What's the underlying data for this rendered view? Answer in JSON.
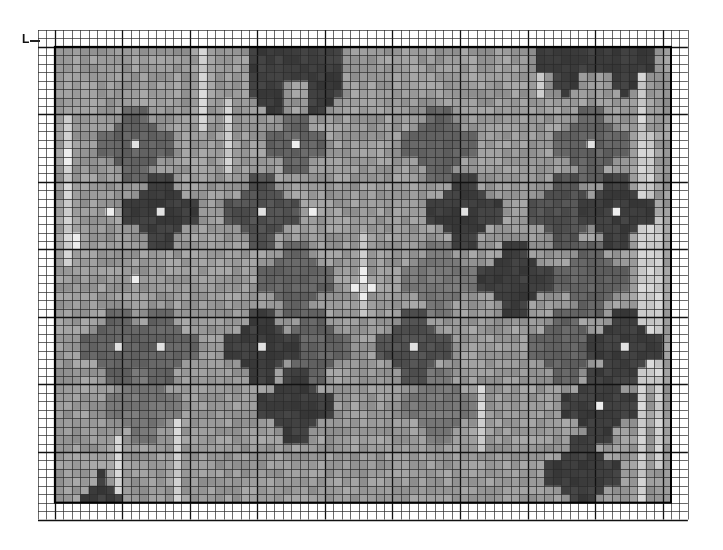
{
  "chart": {
    "type": "needlepoint-grid-chart",
    "marker_label": "L",
    "outer_grid": {
      "x": 38,
      "y": 30,
      "cols": 77,
      "rows": 58,
      "cell": 8.44
    },
    "pattern": {
      "col_offset": 2,
      "row_offset": 2,
      "cols": 73,
      "rows": 54
    },
    "major_every": 8,
    "colors": {
      "background": "#ffffff",
      "grid_line": "#2a2a2a",
      "major_line": "#111111",
      "base_fill": "#9a9a9a",
      "light_fill": "#d6d6d6",
      "highlight_fill": "#f2f2f2",
      "dark_fill": "#3a3a3a"
    },
    "motifs": [
      {
        "col": 9,
        "row": 11,
        "size": 4,
        "shade": "medium",
        "center": "light"
      },
      {
        "col": 12,
        "row": 19,
        "size": 4,
        "shade": "dark",
        "center": "light"
      },
      {
        "col": 7,
        "row": 35,
        "size": 4,
        "shade": "medium",
        "center": "light"
      },
      {
        "col": 12,
        "row": 35,
        "size": 4,
        "shade": "medium",
        "center": "light"
      },
      {
        "col": 10,
        "row": 42,
        "size": 4,
        "shade": "faint",
        "center": "none"
      },
      {
        "col": 5,
        "row": 53,
        "size": 3,
        "shade": "dark",
        "center": "none",
        "kind": "triangle"
      },
      {
        "col": 28,
        "row": 5,
        "size": 5,
        "shade": "dark",
        "center": "none",
        "kind": "arch"
      },
      {
        "col": 28,
        "row": 11,
        "size": 3,
        "shade": "medium",
        "center": "light"
      },
      {
        "col": 24,
        "row": 19,
        "size": 4,
        "shade": "medium-dark",
        "center": "light"
      },
      {
        "col": 28,
        "row": 27,
        "size": 4,
        "shade": "medium",
        "center": "none"
      },
      {
        "col": 24,
        "row": 35,
        "size": 4,
        "shade": "dark",
        "center": "light"
      },
      {
        "col": 30,
        "row": 35,
        "size": 4,
        "shade": "medium",
        "center": "none"
      },
      {
        "col": 28,
        "row": 42,
        "size": 4,
        "shade": "dark",
        "center": "none"
      },
      {
        "col": 45,
        "row": 11,
        "size": 4,
        "shade": "medium",
        "center": "none"
      },
      {
        "col": 48,
        "row": 19,
        "size": 4,
        "shade": "dark",
        "center": "light"
      },
      {
        "col": 45,
        "row": 27,
        "size": 4,
        "shade": "faint",
        "center": "none"
      },
      {
        "col": 42,
        "row": 35,
        "size": 4,
        "shade": "medium-dark",
        "center": "light"
      },
      {
        "col": 45,
        "row": 42,
        "size": 4,
        "shade": "faint",
        "center": "none"
      },
      {
        "col": 54,
        "row": 27,
        "size": 4,
        "shade": "dark",
        "center": "none"
      },
      {
        "col": 60,
        "row": 2,
        "size": 4,
        "shade": "dark",
        "center": "none",
        "kind": "top"
      },
      {
        "col": 67,
        "row": 2,
        "size": 4,
        "shade": "dark",
        "center": "none",
        "kind": "top"
      },
      {
        "col": 63,
        "row": 11,
        "size": 4,
        "shade": "medium",
        "center": "light"
      },
      {
        "col": 60,
        "row": 19,
        "size": 4,
        "shade": "medium-dark",
        "center": "none"
      },
      {
        "col": 66,
        "row": 19,
        "size": 4,
        "shade": "dark",
        "center": "light"
      },
      {
        "col": 63,
        "row": 27,
        "size": 4,
        "shade": "medium",
        "center": "none"
      },
      {
        "col": 60,
        "row": 35,
        "size": 4,
        "shade": "medium",
        "center": "none"
      },
      {
        "col": 67,
        "row": 35,
        "size": 4,
        "shade": "dark",
        "center": "light"
      },
      {
        "col": 64,
        "row": 42,
        "size": 4,
        "shade": "dark",
        "center": "light"
      },
      {
        "col": 62,
        "row": 50,
        "size": 4,
        "shade": "dark",
        "center": "none"
      }
    ],
    "highlights": [
      {
        "col": 6,
        "row": 19
      },
      {
        "col": 9,
        "row": 27
      },
      {
        "col": 28,
        "row": 11
      },
      {
        "col": 30,
        "row": 19
      },
      {
        "col": 36,
        "row": 27
      },
      {
        "col": 37,
        "row": 28
      },
      {
        "col": 36,
        "row": 29
      },
      {
        "col": 35,
        "row": 28
      },
      {
        "col": 36,
        "row": 26
      },
      {
        "col": 64,
        "row": 42
      },
      {
        "col": 66,
        "row": 19
      },
      {
        "col": 1,
        "row": 12
      },
      {
        "col": 1,
        "row": 13
      },
      {
        "col": 2,
        "row": 22
      },
      {
        "col": 2,
        "row": 23
      }
    ],
    "light_columns": [
      {
        "col": 1,
        "from": 8,
        "to": 26
      },
      {
        "col": 17,
        "from": 0,
        "to": 10
      },
      {
        "col": 20,
        "from": 6,
        "to": 15
      },
      {
        "col": 36,
        "from": 22,
        "to": 32
      },
      {
        "col": 50,
        "from": 40,
        "to": 48
      },
      {
        "col": 57,
        "from": 0,
        "to": 6
      },
      {
        "col": 69,
        "from": 0,
        "to": 54
      },
      {
        "col": 70,
        "from": 10,
        "to": 40
      },
      {
        "col": 71,
        "from": 20,
        "to": 50
      },
      {
        "col": 14,
        "from": 44,
        "to": 54
      },
      {
        "col": 7,
        "from": 46,
        "to": 54
      }
    ]
  }
}
